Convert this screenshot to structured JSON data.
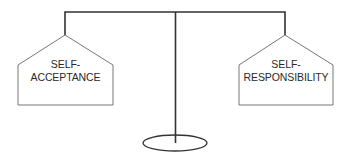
{
  "diagram": {
    "type": "balance-scale",
    "colors": {
      "line": "#333333",
      "thin_line": "#777777",
      "background": "#ffffff",
      "text": "#2a2a2a"
    },
    "left_pan": {
      "line1": "SELF-",
      "line2": "ACCEPTANCE"
    },
    "right_pan": {
      "line1": "SELF-",
      "line2": "RESPONSIBILITY"
    }
  }
}
